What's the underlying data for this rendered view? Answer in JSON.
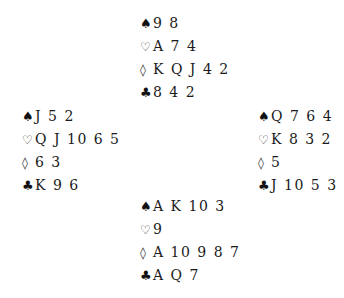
{
  "diagram": {
    "type": "bridge-deal",
    "suit_symbols": {
      "spades": "♠",
      "hearts": "♡",
      "diamonds": "◊",
      "clubs": "♣"
    },
    "hands": {
      "north": {
        "spades": "9 8",
        "hearts": "A 7 4",
        "diamonds": "K Q J 4 2",
        "clubs": "8 4 2"
      },
      "west": {
        "spades": "J 5 2",
        "hearts": "Q J 10 6 5",
        "diamonds": "6 3",
        "clubs": "K 9 6"
      },
      "east": {
        "spades": "Q 7 6 4",
        "hearts": "K 8 3 2",
        "diamonds": "5",
        "clubs": "J 10 5 3"
      },
      "south": {
        "spades": "A K 10 3",
        "hearts": "9",
        "diamonds": "A 10 9 8 7",
        "clubs": "A Q 7"
      }
    }
  }
}
